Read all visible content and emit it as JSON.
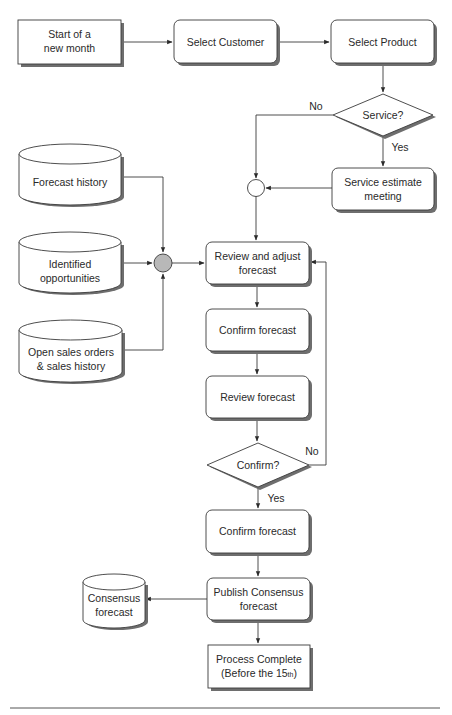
{
  "diagram": {
    "type": "flowchart",
    "nodes": {
      "start": {
        "label_lines": [
          "Start of a",
          "new month"
        ],
        "shape": "rectangle"
      },
      "select_customer": {
        "label_lines": [
          "Select Customer"
        ],
        "shape": "rounded-rectangle"
      },
      "select_product": {
        "label_lines": [
          "Select Product"
        ],
        "shape": "rounded-rectangle"
      },
      "service_decision": {
        "label_lines": [
          "Service?"
        ],
        "shape": "diamond"
      },
      "service_estimate": {
        "label_lines": [
          "Service estimate",
          "meeting"
        ],
        "shape": "rounded-rectangle"
      },
      "merge_1": {
        "shape": "circle",
        "fill": "#ffffff"
      },
      "forecast_history": {
        "label_lines": [
          "Forecast history"
        ],
        "shape": "cylinder"
      },
      "identified_opportunities": {
        "label_lines": [
          "Identified",
          "opportunities"
        ],
        "shape": "cylinder"
      },
      "open_sales_orders": {
        "label_lines": [
          "Open sales orders",
          "& sales history"
        ],
        "shape": "cylinder"
      },
      "merge_2": {
        "shape": "circle",
        "fill": "#b8b8b8"
      },
      "review_adjust": {
        "label_lines": [
          "Review and adjust",
          "forecast"
        ],
        "shape": "rounded-rectangle"
      },
      "confirm_forecast_1": {
        "label_lines": [
          "Confirm forecast"
        ],
        "shape": "rounded-rectangle"
      },
      "review_forecast": {
        "label_lines": [
          "Review forecast"
        ],
        "shape": "rounded-rectangle"
      },
      "confirm_decision": {
        "label_lines": [
          "Confirm?"
        ],
        "shape": "diamond"
      },
      "confirm_forecast_2": {
        "label_lines": [
          "Confirm forecast"
        ],
        "shape": "rounded-rectangle"
      },
      "publish_consensus": {
        "label_lines": [
          "Publish Consensus",
          "forecast"
        ],
        "shape": "rounded-rectangle"
      },
      "consensus_forecast": {
        "label_lines": [
          "Consensus",
          "forecast"
        ],
        "shape": "cylinder"
      },
      "process_complete": {
        "label_lines": [
          "Process Complete",
          "(Before the 15"
        ],
        "superscript": "th",
        "closing": ")",
        "shape": "rectangle"
      }
    },
    "edge_labels": {
      "service_no": "No",
      "service_yes": "Yes",
      "confirm_no": "No",
      "confirm_yes": "Yes"
    },
    "edges": [
      {
        "from": "start",
        "to": "select_customer"
      },
      {
        "from": "select_customer",
        "to": "select_product"
      },
      {
        "from": "select_product",
        "to": "service_decision"
      },
      {
        "from": "service_decision",
        "to": "service_estimate",
        "label": "Yes"
      },
      {
        "from": "service_decision",
        "to": "merge_1",
        "label": "No"
      },
      {
        "from": "service_estimate",
        "to": "merge_1"
      },
      {
        "from": "merge_1",
        "to": "review_adjust"
      },
      {
        "from": "forecast_history",
        "to": "merge_2"
      },
      {
        "from": "identified_opportunities",
        "to": "merge_2"
      },
      {
        "from": "open_sales_orders",
        "to": "merge_2"
      },
      {
        "from": "merge_2",
        "to": "review_adjust"
      },
      {
        "from": "review_adjust",
        "to": "confirm_forecast_1"
      },
      {
        "from": "confirm_forecast_1",
        "to": "review_forecast"
      },
      {
        "from": "review_forecast",
        "to": "confirm_decision"
      },
      {
        "from": "confirm_decision",
        "to": "review_adjust",
        "label": "No"
      },
      {
        "from": "confirm_decision",
        "to": "confirm_forecast_2",
        "label": "Yes"
      },
      {
        "from": "confirm_forecast_2",
        "to": "publish_consensus"
      },
      {
        "from": "publish_consensus",
        "to": "consensus_forecast"
      },
      {
        "from": "publish_consensus",
        "to": "process_complete"
      }
    ]
  },
  "colors": {
    "stroke": "#3a3a3a",
    "shadow": "#6e6e6e",
    "merge_gray": "#b8b8b8",
    "background": "#ffffff"
  }
}
